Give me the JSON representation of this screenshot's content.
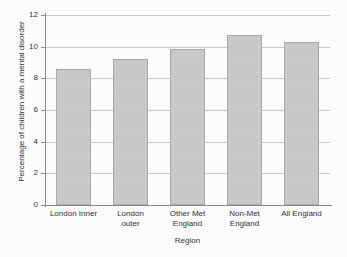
{
  "chart_data": {
    "type": "bar",
    "title": "",
    "subtitle": "",
    "xlabel": "Region",
    "ylabel": "Percentage of children with a mental disorder",
    "categories": [
      "London Inner",
      "London outer",
      "Other Met England",
      "Non-Met England",
      "All England"
    ],
    "values": [
      8.6,
      9.2,
      9.85,
      10.75,
      10.3
    ],
    "series": [
      {
        "name": "Percentage of children with a mental disorder",
        "values": [
          8.6,
          9.2,
          9.85,
          10.75,
          10.3
        ]
      }
    ],
    "ylim": [
      0,
      12
    ],
    "yticks": [
      0,
      2,
      4,
      6,
      8,
      10,
      12
    ],
    "ytick_labels": [
      "0",
      "2",
      "4",
      "6",
      "8",
      "10",
      "12"
    ],
    "grid": "horizontal",
    "legend": "none",
    "bar_color": "#c9c9c9",
    "bar_edge_color": "#a9a9a9",
    "axis_color": "#8a8a8a",
    "gridline_color": "#c9c9c9",
    "background_color": "#ffffff",
    "annotations": []
  },
  "axis": {
    "y_title": "Percentage of children with a mental disorder",
    "x_title": "Region",
    "ticks": [
      {
        "label": "12",
        "value": 12
      },
      {
        "label": "10",
        "value": 10
      },
      {
        "label": "8",
        "value": 8
      },
      {
        "label": "6",
        "value": 6
      },
      {
        "label": "4",
        "value": 4
      },
      {
        "label": "2",
        "value": 2
      },
      {
        "label": "0",
        "value": 0
      }
    ]
  },
  "bars": [
    {
      "label_line1": "London Inner",
      "label_line2": "",
      "value": 8.6
    },
    {
      "label_line1": "London",
      "label_line2": "outer",
      "value": 9.2
    },
    {
      "label_line1": "Other Met",
      "label_line2": "England",
      "value": 9.85
    },
    {
      "label_line1": "Non-Met",
      "label_line2": "England",
      "value": 10.75
    },
    {
      "label_line1": "All England",
      "label_line2": "",
      "value": 10.3
    }
  ]
}
